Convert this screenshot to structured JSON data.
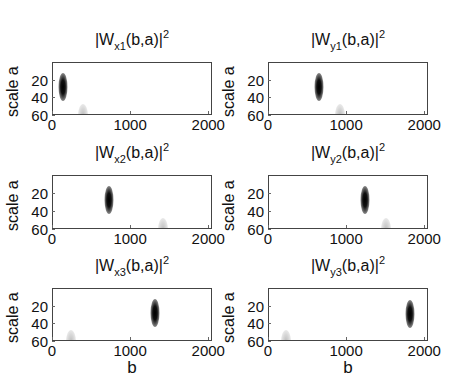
{
  "chart_data": [
    {
      "type": "heatmap",
      "title": "|W_x1(b,a)|^2",
      "title_main": "|W",
      "title_sub": "x1",
      "title_rest": "(b,a)|",
      "title_sup": "2",
      "xlabel": "",
      "ylabel": "scale a",
      "xlim": [
        0,
        2048
      ],
      "ylim": [
        0,
        60
      ],
      "xticks": [
        "0",
        "1000",
        "2000"
      ],
      "yticks": [
        "20",
        "40",
        "60"
      ],
      "colormap": "gray inverted",
      "features": [
        {
          "b": 128,
          "a": 27,
          "intensity": "strong"
        },
        {
          "b": 384,
          "a": 55,
          "intensity": "faint"
        }
      ]
    },
    {
      "type": "heatmap",
      "title": "|W_y1(b,a)|^2",
      "title_main": "|W",
      "title_sub": "y1",
      "title_rest": "(b,a)|",
      "title_sup": "2",
      "xlabel": "",
      "ylabel": "scale a",
      "xlim": [
        0,
        2048
      ],
      "ylim": [
        0,
        60
      ],
      "xticks": [
        "0",
        "1000",
        "2000"
      ],
      "yticks": [
        "20",
        "40",
        "60"
      ],
      "colormap": "gray inverted",
      "features": [
        {
          "b": 640,
          "a": 27,
          "intensity": "strong"
        },
        {
          "b": 910,
          "a": 55,
          "intensity": "faint"
        }
      ]
    },
    {
      "type": "heatmap",
      "title": "|W_x2(b,a)|^2",
      "title_main": "|W",
      "title_sub": "x2",
      "title_rest": "(b,a)|",
      "title_sup": "2",
      "xlabel": "",
      "ylabel": "scale a",
      "xlim": [
        0,
        2048
      ],
      "ylim": [
        0,
        60
      ],
      "xticks": [
        "0",
        "1000",
        "2000"
      ],
      "yticks": [
        "20",
        "40",
        "60"
      ],
      "colormap": "gray inverted",
      "features": [
        {
          "b": 717,
          "a": 27,
          "intensity": "strong"
        },
        {
          "b": 1408,
          "a": 55,
          "intensity": "faint"
        }
      ]
    },
    {
      "type": "heatmap",
      "title": "|W_y2(b,a)|^2",
      "title_main": "|W",
      "title_sub": "y2",
      "title_rest": "(b,a)|",
      "title_sup": "2",
      "xlabel": "",
      "ylabel": "scale a",
      "xlim": [
        0,
        2048
      ],
      "ylim": [
        0,
        60
      ],
      "xticks": [
        "0",
        "1000",
        "2000"
      ],
      "yticks": [
        "20",
        "40",
        "60"
      ],
      "colormap": "gray inverted",
      "features": [
        {
          "b": 1229,
          "a": 27,
          "intensity": "strong"
        },
        {
          "b": 1498,
          "a": 55,
          "intensity": "faint"
        }
      ]
    },
    {
      "type": "heatmap",
      "title": "|W_x3(b,a)|^2",
      "title_main": "|W",
      "title_sub": "x3",
      "title_rest": "(b,a)|",
      "title_sup": "2",
      "xlabel": "b",
      "ylabel": "scale a",
      "xlim": [
        0,
        2048
      ],
      "ylim": [
        0,
        60
      ],
      "xticks": [
        "0",
        "1000",
        "2000"
      ],
      "yticks": [
        "20",
        "40",
        "60"
      ],
      "colormap": "gray inverted",
      "features": [
        {
          "b": 1306,
          "a": 27,
          "intensity": "strong"
        },
        {
          "b": 230,
          "a": 55,
          "intensity": "faint"
        }
      ]
    },
    {
      "type": "heatmap",
      "title": "|W_y3(b,a)|^2",
      "title_main": "|W",
      "title_sub": "y3",
      "title_rest": "(b,a)|",
      "title_sup": "2",
      "xlabel": "b",
      "ylabel": "scale a",
      "xlim": [
        0,
        2048
      ],
      "ylim": [
        0,
        60
      ],
      "xticks": [
        "0",
        "1000",
        "2000"
      ],
      "yticks": [
        "20",
        "40",
        "60"
      ],
      "colormap": "gray inverted",
      "features": [
        {
          "b": 1800,
          "a": 28,
          "intensity": "strong"
        },
        {
          "b": 218,
          "a": 56,
          "intensity": "faint"
        }
      ]
    }
  ]
}
